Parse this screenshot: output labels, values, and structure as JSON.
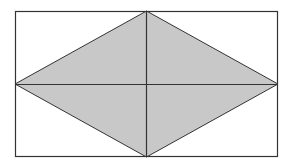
{
  "diagram": {
    "caption": "",
    "rectangle": {
      "x1": 15,
      "y1": 11,
      "x2": 278,
      "y2": 157
    },
    "rhombus": {
      "top": [
        146.5,
        11
      ],
      "right": [
        278,
        84
      ],
      "bottom": [
        146.5,
        157
      ],
      "left": [
        15,
        84
      ]
    },
    "colors": {
      "fill": "#c8c8c8",
      "stroke": "#333333",
      "background": "#ffffff"
    }
  }
}
